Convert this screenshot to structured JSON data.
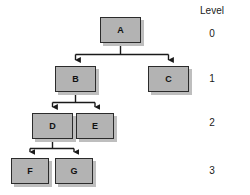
{
  "diagram": {
    "title_column": "Level",
    "nodes": [
      {
        "id": "A",
        "label": "A",
        "level": 0,
        "x": 100,
        "y": 17,
        "w": 41,
        "h": 26
      },
      {
        "id": "B",
        "label": "B",
        "level": 1,
        "x": 55,
        "y": 66,
        "w": 41,
        "h": 26
      },
      {
        "id": "C",
        "label": "C",
        "level": 1,
        "x": 148,
        "y": 66,
        "w": 41,
        "h": 26
      },
      {
        "id": "D",
        "label": "D",
        "level": 2,
        "x": 32,
        "y": 113,
        "w": 41,
        "h": 26
      },
      {
        "id": "E",
        "label": "E",
        "level": 2,
        "x": 76,
        "y": 113,
        "w": 38,
        "h": 26
      },
      {
        "id": "F",
        "label": "F",
        "level": 3,
        "x": 11,
        "y": 158,
        "w": 38,
        "h": 26
      },
      {
        "id": "G",
        "label": "G",
        "level": 3,
        "x": 55,
        "y": 158,
        "w": 38,
        "h": 26
      }
    ],
    "edges": [
      {
        "from": "A",
        "to": "B"
      },
      {
        "from": "A",
        "to": "C"
      },
      {
        "from": "B",
        "to": "D"
      },
      {
        "from": "B",
        "to": "E"
      },
      {
        "from": "D",
        "to": "F"
      },
      {
        "from": "D",
        "to": "G"
      }
    ],
    "levels": [
      {
        "value": "0",
        "y": 29
      },
      {
        "value": "1",
        "y": 74
      },
      {
        "value": "2",
        "y": 118
      },
      {
        "value": "3",
        "y": 166
      }
    ],
    "level_column_x": 212,
    "level_header_y": 6,
    "colors": {
      "node_fill": "#b3b3b3",
      "node_border": "#2b2b2b",
      "node_shadow": "#bebebe",
      "edge": "#1a1a1a",
      "text": "#111111",
      "background": "#ffffff"
    }
  }
}
